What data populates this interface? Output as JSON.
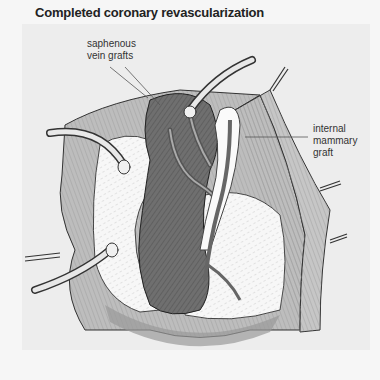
{
  "figure": {
    "title": "Completed coronary revascularization",
    "labels": {
      "saphenous_line1": "saphenous",
      "saphenous_line2": "vein  grafts",
      "internal_line1": "internal",
      "internal_line2": "mammary",
      "internal_line3": "graft"
    },
    "colors": {
      "background": "#f6f6f6",
      "panel": "#ededed",
      "myocardium": "#6e6e6e",
      "fat": "#fafafa",
      "pericardium": "#b8b8b8",
      "ink": "#2a2a2a"
    }
  }
}
